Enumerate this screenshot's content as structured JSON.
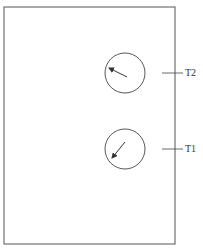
{
  "diagram": {
    "frame": {
      "x": 4,
      "y": 7,
      "width": 171,
      "height": 237
    },
    "elements": [
      {
        "id": "T2",
        "label": "T2",
        "circle": {
          "cx": 125,
          "cy": 73,
          "r": 20
        },
        "arrow": {
          "x1": 127,
          "y1": 77,
          "x2": 107,
          "y2": 67
        },
        "tick_y": 73
      },
      {
        "id": "T1",
        "label": "T1",
        "circle": {
          "cx": 125,
          "cy": 149,
          "r": 20
        },
        "arrow": {
          "x1": 125,
          "y1": 142,
          "x2": 111,
          "y2": 160
        },
        "tick_y": 149
      }
    ],
    "colors": {
      "stroke": "#444444",
      "text": "#333333"
    }
  }
}
